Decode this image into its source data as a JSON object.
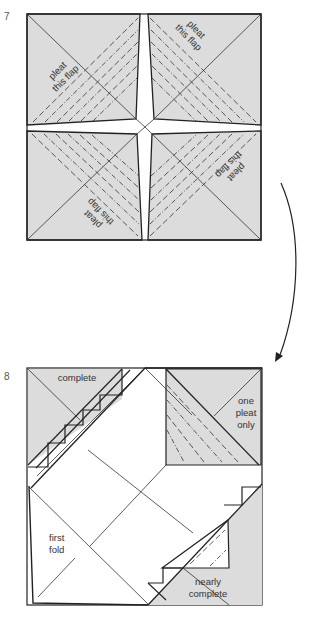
{
  "steps": [
    {
      "number": "7",
      "labels": {
        "top_left": [
          "pleat",
          "this flap"
        ],
        "top_right": [
          "pleat",
          "this flap"
        ],
        "bottom_right": [
          "pleat",
          "this flap"
        ],
        "bottom_left": [
          "pleat",
          "this flap"
        ]
      }
    },
    {
      "number": "8",
      "labels": {
        "top_left": "complete",
        "top_right": [
          "one",
          "pleat",
          "only"
        ],
        "bottom_left": [
          "first",
          "fold"
        ],
        "bottom_right": [
          "nearly",
          "complete"
        ]
      }
    }
  ],
  "arrow": {
    "icon": "curved-arrow-down-icon"
  },
  "colors": {
    "paper_shade": "#dcdcdc",
    "paper_white": "#ffffff",
    "line": "#222222"
  }
}
